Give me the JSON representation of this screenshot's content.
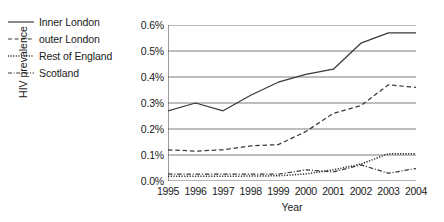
{
  "chart_data": {
    "type": "line",
    "title": "",
    "xlabel": "Year",
    "ylabel": "HIV prevalence",
    "categories": [
      1995,
      1996,
      1997,
      1998,
      1999,
      2000,
      2001,
      2002,
      2003,
      2004
    ],
    "xtick_labels": [
      "1995",
      "1996",
      "1997",
      "1998",
      "1999",
      "2000",
      "2001",
      "2002",
      "2003",
      "2004"
    ],
    "ytick_labels": [
      "0.0%",
      "0.1%",
      "0.2%",
      "0.3%",
      "0.4%",
      "0.5%",
      "0.6%"
    ],
    "ytick_values": [
      0.0,
      0.1,
      0.2,
      0.3,
      0.4,
      0.5,
      0.6
    ],
    "ylim": [
      0.0,
      0.6
    ],
    "xlim": [
      1995,
      2004
    ],
    "grid": "horizontal",
    "legend_position": "outside-top-left",
    "units": "percent",
    "series": [
      {
        "name": "Inner London",
        "style": "solid",
        "color": "#3a3a3a",
        "values": [
          0.27,
          0.3,
          0.27,
          0.33,
          0.38,
          0.41,
          0.43,
          0.53,
          0.57,
          0.57
        ]
      },
      {
        "name": "outer London",
        "style": "dashed",
        "color": "#3a3a3a",
        "values": [
          0.12,
          0.115,
          0.12,
          0.135,
          0.14,
          0.19,
          0.26,
          0.29,
          0.37,
          0.36
        ]
      },
      {
        "name": "Rest of England",
        "style": "dotted",
        "color": "#2b2b2b",
        "values": [
          0.018,
          0.018,
          0.018,
          0.019,
          0.02,
          0.027,
          0.043,
          0.065,
          0.105,
          0.105
        ]
      },
      {
        "name": "Scotland",
        "style": "dashdot",
        "color": "#3a3a3a",
        "values": [
          0.027,
          0.026,
          0.026,
          0.026,
          0.026,
          0.043,
          0.035,
          0.062,
          0.03,
          0.048
        ]
      }
    ]
  },
  "legend": {
    "items": [
      {
        "label": "Inner London",
        "style": "solid"
      },
      {
        "label": "outer London",
        "style": "dashed"
      },
      {
        "label": "Rest of England",
        "style": "dotted"
      },
      {
        "label": "Scotland",
        "style": "dashdot"
      }
    ]
  }
}
